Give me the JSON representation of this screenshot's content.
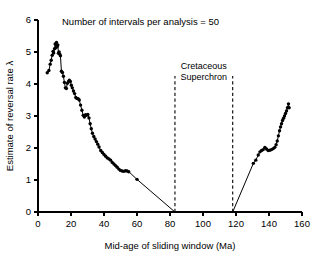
{
  "chart_data": {
    "type": "line",
    "title": "Number of intervals per analysis = 50",
    "xlabel": "Mid-age of sliding window (Ma)",
    "ylabel": "Estimate of reversal rate λ",
    "xlim": [
      0,
      160
    ],
    "ylim": [
      0,
      6
    ],
    "xticks": [
      0,
      20,
      40,
      60,
      80,
      100,
      120,
      140,
      160
    ],
    "yticks": [
      0,
      1,
      2,
      3,
      4,
      5,
      6
    ],
    "xtick_labels": [
      "0",
      "20",
      "40",
      "60",
      "80",
      "100",
      "120",
      "140",
      "160"
    ],
    "ytick_labels": [
      "0",
      "1",
      "2",
      "3",
      "4",
      "5",
      "6"
    ],
    "grid": false,
    "legend": "none",
    "marker": "filled-circle",
    "line_color": "#000000",
    "marker_color": "#000000",
    "background": "#ffffff",
    "annotations": [
      {
        "name": "cretaceous-superchron",
        "text_line1": "Cretaceous",
        "text_line2": "Superchron",
        "x_start": 83,
        "x_end": 118,
        "style": "dashed-vertical-pair",
        "y_top": 4.25,
        "y_bottom": 0
      }
    ],
    "series": [
      {
        "name": "Reversal rate (Cenozoic branch)",
        "points": [
          [
            5.6,
            4.35
          ],
          [
            6.6,
            4.42
          ],
          [
            7.4,
            4.62
          ],
          [
            8.0,
            4.74
          ],
          [
            8.6,
            4.9
          ],
          [
            9.1,
            5.02
          ],
          [
            9.5,
            4.97
          ],
          [
            10.0,
            5.1
          ],
          [
            10.4,
            5.25
          ],
          [
            10.8,
            5.13
          ],
          [
            11.2,
            5.3
          ],
          [
            11.6,
            5.17
          ],
          [
            12.0,
            5.22
          ],
          [
            12.4,
            4.96
          ],
          [
            12.8,
            5.0
          ],
          [
            13.2,
            4.93
          ],
          [
            13.6,
            4.88
          ],
          [
            14.2,
            4.4
          ],
          [
            14.8,
            4.36
          ],
          [
            15.4,
            4.24
          ],
          [
            16.0,
            4.05
          ],
          [
            16.6,
            3.88
          ],
          [
            17.2,
            3.86
          ],
          [
            17.8,
            4.02
          ],
          [
            18.4,
            4.07
          ],
          [
            19.0,
            4.12
          ],
          [
            19.6,
            4.08
          ],
          [
            20.2,
            3.96
          ],
          [
            20.8,
            3.88
          ],
          [
            21.5,
            3.78
          ],
          [
            22.2,
            3.7
          ],
          [
            22.9,
            3.58
          ],
          [
            23.6,
            3.55
          ],
          [
            24.3,
            3.54
          ],
          [
            25.0,
            3.5
          ],
          [
            25.8,
            3.34
          ],
          [
            26.6,
            3.18
          ],
          [
            27.4,
            3.02
          ],
          [
            28.1,
            2.97
          ],
          [
            28.8,
            3.04
          ],
          [
            29.5,
            3.02
          ],
          [
            30.2,
            3.05
          ],
          [
            30.9,
            2.94
          ],
          [
            31.6,
            2.76
          ],
          [
            32.3,
            2.6
          ],
          [
            33.0,
            2.46
          ],
          [
            33.8,
            2.36
          ],
          [
            34.6,
            2.28
          ],
          [
            35.4,
            2.2
          ],
          [
            36.2,
            2.12
          ],
          [
            37.0,
            2.03
          ],
          [
            38.0,
            1.92
          ],
          [
            39.0,
            1.86
          ],
          [
            40.0,
            1.8
          ],
          [
            41.0,
            1.74
          ],
          [
            42.0,
            1.69
          ],
          [
            43.0,
            1.66
          ],
          [
            44.0,
            1.62
          ],
          [
            45.0,
            1.55
          ],
          [
            46.0,
            1.5
          ],
          [
            47.0,
            1.45
          ],
          [
            48.0,
            1.4
          ],
          [
            49.0,
            1.34
          ],
          [
            50.0,
            1.3
          ],
          [
            51.0,
            1.28
          ],
          [
            52.0,
            1.27
          ],
          [
            53.0,
            1.29
          ],
          [
            54.0,
            1.28
          ],
          [
            55.0,
            1.26
          ],
          [
            60.0,
            1.02
          ],
          [
            83.0,
            0.0
          ]
        ]
      },
      {
        "name": "Reversal rate (Jurassic-Cretaceous branch)",
        "points": [
          [
            118.0,
            0.0
          ],
          [
            130.5,
            1.52
          ],
          [
            132.0,
            1.62
          ],
          [
            133.5,
            1.78
          ],
          [
            134.5,
            1.88
          ],
          [
            135.5,
            1.92
          ],
          [
            136.5,
            1.95
          ],
          [
            137.5,
            2.02
          ],
          [
            138.5,
            1.97
          ],
          [
            139.5,
            1.92
          ],
          [
            140.5,
            1.93
          ],
          [
            141.5,
            1.95
          ],
          [
            142.5,
            1.98
          ],
          [
            143.5,
            2.02
          ],
          [
            144.3,
            2.1
          ],
          [
            145.0,
            2.22
          ],
          [
            145.7,
            2.38
          ],
          [
            146.4,
            2.54
          ],
          [
            147.0,
            2.66
          ],
          [
            147.6,
            2.76
          ],
          [
            148.2,
            2.86
          ],
          [
            148.8,
            2.93
          ],
          [
            149.4,
            3.0
          ],
          [
            150.0,
            3.08
          ],
          [
            150.6,
            3.16
          ],
          [
            151.2,
            3.26
          ],
          [
            151.8,
            3.38
          ],
          [
            152.2,
            3.26
          ]
        ]
      }
    ]
  }
}
